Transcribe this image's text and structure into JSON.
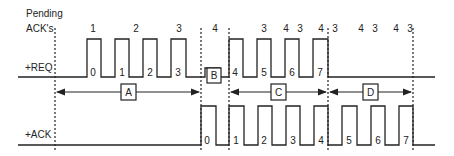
{
  "labels": {
    "pending": "Pending",
    "acks": "ACK's",
    "req": "+REQ",
    "ack": "+ACK"
  },
  "colors": {
    "line": "#222222",
    "background": "#ffffff"
  },
  "pending_counts": [
    {
      "x": 93,
      "text": "1"
    },
    {
      "x": 136,
      "text": "2"
    },
    {
      "x": 179,
      "text": "3"
    },
    {
      "x": 215,
      "text": "4"
    },
    {
      "x": 264,
      "text": "3"
    },
    {
      "x": 286,
      "text": "4"
    },
    {
      "x": 300,
      "text": "3"
    },
    {
      "x": 321,
      "text": "4"
    },
    {
      "x": 335,
      "text": "3"
    },
    {
      "x": 361,
      "text": "4"
    },
    {
      "x": 375,
      "text": "3"
    },
    {
      "x": 396,
      "text": "4"
    },
    {
      "x": 410,
      "text": "3"
    }
  ],
  "req_pulse_labels": [
    {
      "x": 93,
      "text": "0"
    },
    {
      "x": 122,
      "text": "1"
    },
    {
      "x": 150,
      "text": "2"
    },
    {
      "x": 178,
      "text": "3"
    },
    {
      "x": 235,
      "text": "4"
    },
    {
      "x": 264,
      "text": "5"
    },
    {
      "x": 292,
      "text": "6"
    },
    {
      "x": 320,
      "text": "7"
    }
  ],
  "ack_pulse_labels": [
    {
      "x": 207,
      "text": "0"
    },
    {
      "x": 236,
      "text": "1"
    },
    {
      "x": 264,
      "text": "2"
    },
    {
      "x": 293,
      "text": "3"
    },
    {
      "x": 321,
      "text": "4"
    },
    {
      "x": 349,
      "text": "5"
    },
    {
      "x": 378,
      "text": "6"
    },
    {
      "x": 406,
      "text": "7"
    }
  ],
  "intervals": [
    {
      "label": "A",
      "x1": 55,
      "x2": 201
    },
    {
      "label": "C",
      "x1": 229,
      "x2": 328
    },
    {
      "label": "D",
      "x1": 328,
      "x2": 413
    }
  ],
  "box_b": {
    "label": "B"
  }
}
